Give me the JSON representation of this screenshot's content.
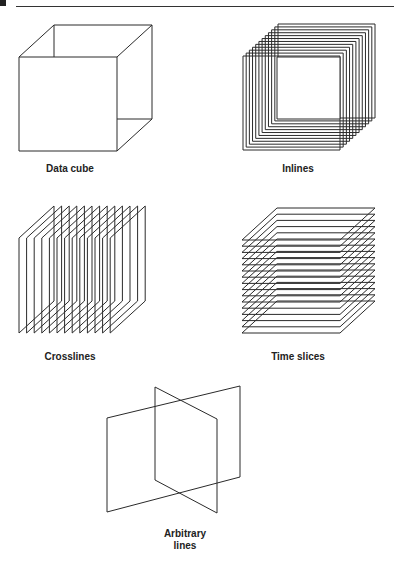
{
  "figure": {
    "panels": [
      {
        "id": "data-cube",
        "label": "Data cube",
        "type": "cube",
        "slices": 1
      },
      {
        "id": "inlines",
        "label": "Inlines",
        "type": "inline-slices",
        "slices": 12
      },
      {
        "id": "crosslines",
        "label": "Crosslines",
        "type": "crossline-slices",
        "slices": 13
      },
      {
        "id": "time-slices",
        "label": "Time slices",
        "type": "time-slices",
        "slices": 16
      },
      {
        "id": "arbitrary-lines",
        "label_line1": "Arbitrary",
        "label_line2": "lines",
        "type": "arbitrary-planes",
        "slices": 2
      }
    ],
    "stroke_color": "#2a2a2a"
  }
}
